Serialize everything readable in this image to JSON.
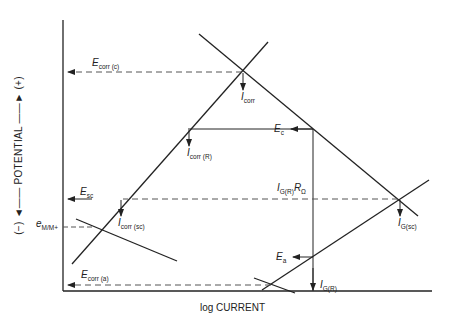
{
  "diagram": {
    "type": "Evans diagram (polarization diagram)",
    "axes": {
      "x_label": "log CURRENT",
      "y_label": "(−) —— POTENTIAL —— (+)",
      "y_label_parts": {
        "neg": "(−)",
        "text": "POTENTIAL",
        "pos": "(+)"
      }
    },
    "labels": {
      "ecorr_c": {
        "main": "E",
        "sub": "corr (c)"
      },
      "icorr": {
        "main": "I",
        "sub": "corr"
      },
      "ec": {
        "main": "E",
        "sub": "c"
      },
      "icorr_r": {
        "main": "I",
        "sub": "corr (R)"
      },
      "esc": {
        "main": "E",
        "sub": "sc"
      },
      "igr_rohm": {
        "main": "I",
        "sub": "G(R)",
        "main2": "R",
        "sub2": "Ω"
      },
      "e_mm": {
        "main": "e",
        "sub": "M/M+"
      },
      "icorr_sc": {
        "main": "I",
        "sub": "corr (sc)"
      },
      "ig_sc": {
        "main": "I",
        "sub": "G(sc)"
      },
      "ea": {
        "main": "E",
        "sub": "a"
      },
      "ecorr_a": {
        "main": "E",
        "sub": "corr (a)"
      },
      "ig_r": {
        "main": "I",
        "sub": "G(R)"
      }
    },
    "line_color": "#222222",
    "dash_color": "#555555"
  }
}
